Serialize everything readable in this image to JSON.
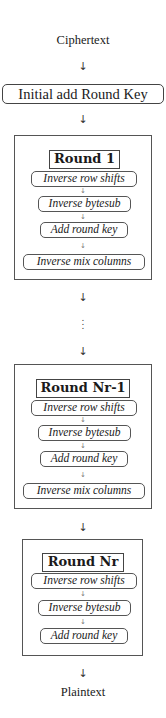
{
  "diagram": {
    "input": "Ciphertext",
    "output": "Plaintext",
    "initial_step": "Initial add Round Key",
    "arrow_glyph": "↓",
    "ellipsis_glyph": "⋮",
    "rounds": [
      {
        "title": "Round 1",
        "steps": [
          "Inverse row shifts",
          "Inverse bytesub",
          "Add round key",
          "Inverse mix columns"
        ]
      },
      {
        "title": "Round Nr-1",
        "steps": [
          "Inverse row shifts",
          "Inverse bytesub",
          "Add round key",
          "Inverse mix columns"
        ]
      },
      {
        "title": "Round Nr",
        "steps": [
          "Inverse row shifts",
          "Inverse bytesub",
          "Add round key"
        ]
      }
    ]
  }
}
